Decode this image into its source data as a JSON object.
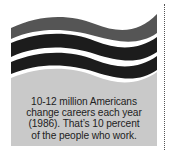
{
  "figure": {
    "caption_lines": [
      "10-12 million Americans",
      "change careers each year",
      "(1986). That’s 10 percent",
      "of the people who work."
    ],
    "colors": {
      "top_band": "#555555",
      "dark_bands": "#1c1c1c",
      "text_area": "#c9c9c9",
      "gap": "#ffffff",
      "text": "#222222"
    }
  }
}
